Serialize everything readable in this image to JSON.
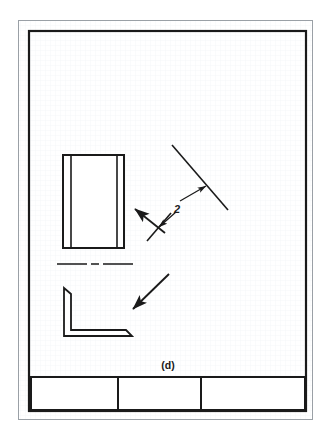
{
  "sheet": {
    "background_color": "#fdfdfd",
    "paper_color": "#ffffff",
    "grid_color": "#eceff1",
    "grid_spacing": 5,
    "ink_color": "#1a1a1a"
  },
  "border": {
    "outer": {
      "x": 18,
      "y": 20,
      "width": 295,
      "height": 400,
      "stroke": "#9aa0a6",
      "stroke_width": 1
    },
    "inner": {
      "x": 28,
      "y": 30,
      "width": 279,
      "height": 382,
      "stroke": "#1a1a1a",
      "stroke_width": 2.2
    }
  },
  "figure_label": {
    "text": "(d)",
    "x": 168,
    "y": 368,
    "font_size": 10
  },
  "title_block": {
    "x": 30,
    "y": 377,
    "width": 275,
    "height": 33,
    "stroke": "#1a1a1a",
    "stroke_width": 2,
    "dividers": [
      {
        "x": 118,
        "label": ""
      },
      {
        "x": 201,
        "label": ""
      }
    ],
    "cells": [
      "",
      "",
      ""
    ]
  },
  "views": {
    "front_view": {
      "name": "rectangular-front-view",
      "x": 63,
      "y": 155,
      "width": 61,
      "height": 93,
      "stroke": "#1a1a1a",
      "stroke_width": 2,
      "inner_lines_x": [
        71,
        117
      ]
    },
    "centerline": {
      "name": "center-line",
      "x1": 57,
      "y1": 264,
      "x2": 135,
      "y2": 264,
      "stroke": "#1a1a1a",
      "stroke_width": 1.6,
      "dash_pattern": "30 4 6 4"
    },
    "angle_view": {
      "name": "l-angle-profile-view",
      "stroke": "#1a1a1a",
      "stroke_width": 1.8,
      "points": "64,288 71,294 71,330 126,330 132,336 64,336"
    }
  },
  "annotations": {
    "cutting_plane_upper": {
      "name": "cutting-plane-line-upper",
      "x1": 172,
      "y1": 145,
      "x2": 228,
      "y2": 210,
      "stroke": "#1a1a1a",
      "stroke_width": 1.6
    },
    "cutting_plane_lower": {
      "name": "cutting-plane-line-lower",
      "x1": 145,
      "y1": 240,
      "x2": 170,
      "y2": 212,
      "stroke": "#1a1a1a",
      "stroke_width": 1.6
    },
    "leader_upper": {
      "name": "leader-line-to-upper-plane",
      "x1": 180,
      "y1": 203,
      "x2": 205,
      "y2": 188,
      "stroke": "#1a1a1a",
      "stroke_width": 1.3
    },
    "leader_lower": {
      "name": "leader-line-to-lower-plane",
      "x1": 178,
      "y1": 210,
      "x2": 158,
      "y2": 228,
      "stroke": "#1a1a1a",
      "stroke_width": 1.3
    },
    "sight_arrow_left": {
      "name": "viewing-direction-arrow-left",
      "x1": 168,
      "y1": 235,
      "x2": 134,
      "y2": 208,
      "stroke": "#1a1a1a",
      "stroke_width": 1.8
    },
    "sight_arrow_down": {
      "name": "viewing-direction-arrow-lower",
      "x1": 170,
      "y1": 274,
      "x2": 130,
      "y2": 312,
      "stroke": "#1a1a1a",
      "stroke_width": 1.8
    },
    "dimension_label": {
      "name": "section-number-2",
      "text": "2",
      "x": 175,
      "y": 212,
      "font_size": 11,
      "italic": true
    }
  }
}
